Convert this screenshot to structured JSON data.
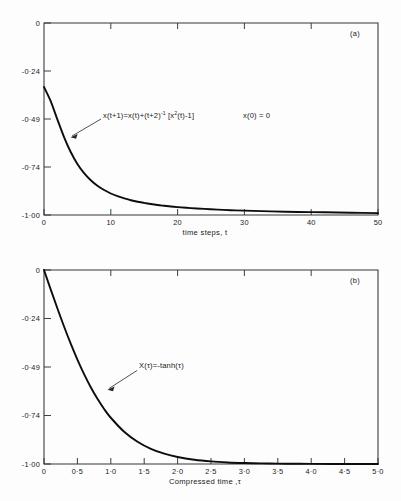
{
  "figure": {
    "background_color": "#fdfdfd",
    "curve_color": "#0d0d0d",
    "axis_color": "#33363a"
  },
  "panels": [
    {
      "tag": "(a)",
      "xlabel": "time steps, t",
      "ylabel": "",
      "equation_main": "x(t+1)=x(t)+(t+2)",
      "equation_sup": "-1",
      "equation_tail": " [x",
      "equation_sup2": "2",
      "equation_tail2": "(t)-1]",
      "initial_condition": "x(0) = 0",
      "xticks": [
        "0",
        "10",
        "20",
        "30",
        "40",
        "50"
      ],
      "yticks": [
        "0",
        "-0·24",
        "-0·49",
        "-0·74",
        "-1·00"
      ]
    },
    {
      "tag": "(b)",
      "xlabel": "Compressed time ,τ",
      "ylabel": "",
      "equation_main": "X(τ)=-tanh(τ)",
      "xticks": [
        "0",
        "0·5",
        "1·0",
        "1·5",
        "2·0",
        "2·5",
        "3·0",
        "3·5",
        "4·0",
        "4·5",
        "5·0"
      ],
      "yticks": [
        "0",
        "-0·24",
        "-0·49",
        "-0·74",
        "-1·00"
      ]
    }
  ],
  "chart_data": [
    {
      "type": "line",
      "title": "(a)",
      "xlabel": "time steps, t",
      "ylabel": "",
      "xlim": [
        0,
        50
      ],
      "ylim": [
        -1.0,
        0.0
      ],
      "xticks": [
        0,
        10,
        20,
        30,
        40,
        50
      ],
      "yticks": [
        0,
        -0.24,
        -0.49,
        -0.74,
        -1.0
      ],
      "grid": false,
      "legend": "none",
      "annotations": [
        {
          "text": "x(t+1)=x(t)+(t+2)^-1 [x^2(t)-1]",
          "x": 8.5,
          "y": -0.455
        },
        {
          "text": "x(0) = 0",
          "x": 31.5,
          "y": -0.455
        }
      ],
      "series": [
        {
          "name": "x(t)",
          "x": [
            0,
            1,
            2,
            3,
            4,
            5,
            6,
            7,
            8,
            9,
            10,
            11,
            12,
            13,
            14,
            15,
            16,
            17,
            18,
            19,
            20,
            22,
            24,
            26,
            28,
            30,
            34,
            38,
            42,
            46,
            50
          ],
          "values": [
            -0.333,
            -0.407,
            -0.502,
            -0.594,
            -0.672,
            -0.734,
            -0.782,
            -0.819,
            -0.848,
            -0.87,
            -0.888,
            -0.902,
            -0.913,
            -0.923,
            -0.931,
            -0.937,
            -0.943,
            -0.948,
            -0.952,
            -0.956,
            -0.959,
            -0.964,
            -0.968,
            -0.972,
            -0.975,
            -0.977,
            -0.981,
            -0.984,
            -0.986,
            -0.988,
            -0.99
          ]
        }
      ]
    },
    {
      "type": "line",
      "title": "(b)",
      "xlabel": "Compressed time ,τ",
      "ylabel": "",
      "xlim": [
        0,
        5.0
      ],
      "ylim": [
        -1.0,
        0.0
      ],
      "xticks": [
        0,
        0.5,
        1.0,
        1.5,
        2.0,
        2.5,
        3.0,
        3.5,
        4.0,
        4.5,
        5.0
      ],
      "yticks": [
        0,
        -0.24,
        -0.49,
        -0.74,
        -1.0
      ],
      "grid": false,
      "legend": "none",
      "annotations": [
        {
          "text": "X(τ)=-tanh(τ)",
          "x": 1.32,
          "y": -0.4
        }
      ],
      "series": [
        {
          "name": "X(τ)=-tanh(τ)",
          "x": [
            0,
            0.1,
            0.2,
            0.3,
            0.4,
            0.5,
            0.6,
            0.7,
            0.8,
            0.9,
            1.0,
            1.2,
            1.4,
            1.6,
            1.8,
            2.0,
            2.25,
            2.5,
            2.75,
            3.0,
            3.25,
            3.5,
            3.75,
            4.0,
            4.5,
            5.0
          ],
          "values": [
            0,
            -0.0997,
            -0.1974,
            -0.2913,
            -0.3799,
            -0.4621,
            -0.537,
            -0.6044,
            -0.664,
            -0.7163,
            -0.7616,
            -0.8337,
            -0.8854,
            -0.9217,
            -0.9468,
            -0.964,
            -0.978,
            -0.9866,
            -0.9919,
            -0.9951,
            -0.997,
            -0.9982,
            -0.9989,
            -0.9993,
            -0.9998,
            -0.9999
          ]
        }
      ]
    }
  ]
}
